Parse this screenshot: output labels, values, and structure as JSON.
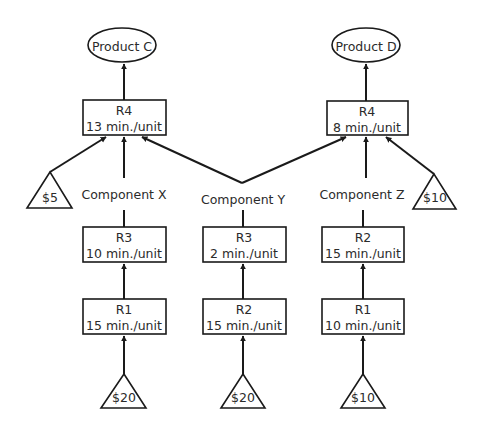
{
  "diagram": {
    "type": "product-flow",
    "colors": {
      "stroke": "#1a1a1a",
      "text": "#2b2b2b",
      "background": "#ffffff"
    },
    "products": [
      {
        "id": "product-c",
        "label": "Product C"
      },
      {
        "id": "product-d",
        "label": "Product D"
      }
    ],
    "resources": {
      "r4_left": {
        "name": "R4",
        "time": "13 min./unit"
      },
      "r4_right": {
        "name": "R4",
        "time": "8 min./unit"
      },
      "r3_x": {
        "name": "R3",
        "time": "10 min./unit"
      },
      "r3_y": {
        "name": "R3",
        "time": "2 min./unit"
      },
      "r2_z": {
        "name": "R2",
        "time": "15 min./unit"
      },
      "r1_x": {
        "name": "R1",
        "time": "15 min./unit"
      },
      "r2_y": {
        "name": "R2",
        "time": "15 min./unit"
      },
      "r1_z": {
        "name": "R1",
        "time": "10 min./unit"
      }
    },
    "components": {
      "x": "Component X",
      "y": "Component Y",
      "z": "Component Z"
    },
    "materials": {
      "purchased_c": "$5",
      "purchased_d": "$10",
      "raw_x": "$20",
      "raw_y": "$20",
      "raw_z": "$10"
    },
    "edges": [
      [
        "raw_x",
        "r1_x"
      ],
      [
        "r1_x",
        "r3_x"
      ],
      [
        "r3_x",
        "r4_left"
      ],
      [
        "raw_y",
        "r2_y"
      ],
      [
        "r2_y",
        "r3_y"
      ],
      [
        "r3_y",
        "r4_left"
      ],
      [
        "r3_y",
        "r4_right"
      ],
      [
        "raw_z",
        "r1_z"
      ],
      [
        "r1_z",
        "r2_z"
      ],
      [
        "r2_z",
        "r4_right"
      ],
      [
        "purchased_c",
        "r4_left"
      ],
      [
        "purchased_d",
        "r4_right"
      ],
      [
        "r4_left",
        "product-c"
      ],
      [
        "r4_right",
        "product-d"
      ]
    ]
  }
}
